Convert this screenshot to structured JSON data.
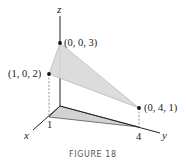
{
  "figure": {
    "caption": "FIGURE 18",
    "axes": {
      "x_label": "x",
      "y_label": "y",
      "z_label": "z",
      "x_tick": "1",
      "y_tick": "4"
    },
    "points": [
      {
        "label": "(0, 0, 3)",
        "coords": [
          0,
          0,
          3
        ]
      },
      {
        "label": "(1, 0, 2)",
        "coords": [
          1,
          0,
          2
        ]
      },
      {
        "label": "(0, 4, 1)",
        "coords": [
          0,
          4,
          1
        ]
      }
    ],
    "colors": {
      "surface_fill": "#d8d8d8",
      "shadow_fill": "#cfcfcf",
      "axis": "#222222",
      "dashed": "#888888"
    }
  }
}
